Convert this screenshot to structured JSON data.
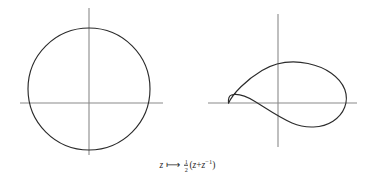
{
  "figure": {
    "background_color": "#ffffff",
    "axis_color": "#8a8a8a",
    "curve_color": "#2b2b2b",
    "caption": {
      "variable": "z",
      "arrow_glyph": "⟼",
      "fraction_numerator": "1",
      "fraction_denominator": "2",
      "open_paren": "(",
      "expr_first": "z",
      "plus": "+",
      "expr_second": "z",
      "exponent": "−1",
      "close_paren": ")",
      "full_text": "z ⟼ ½(z + z⁻¹)"
    },
    "left_panel": {
      "name": "unit-circle-domain",
      "axis_x": {
        "x1": 20,
        "y1": 103,
        "x2": 163,
        "y2": 103
      },
      "axis_y": {
        "x1": 89,
        "y1": 8,
        "x2": 89,
        "y2": 155
      },
      "circle": {
        "cx": 89,
        "cy": 89,
        "r": 61
      }
    },
    "right_panel": {
      "name": "joukowski-image-curve",
      "axis_x": {
        "x1": 208,
        "y1": 103,
        "x2": 357,
        "y2": 103
      },
      "axis_y": {
        "x1": 278,
        "y1": 14,
        "x2": 278,
        "y2": 147
      },
      "curve_path": "M 228.5 103.2 C 233 94 246 80 262 70.5 C 276 62.2 292 60.3 308 63.5 C 326 67 340 77 344.5 89.5 C 349 102 344 114 333 121 C 322 128 306 129 292 123 C 278 117 266 108 255 101.5 C 246 96 237 93.5 231.5 95 C 229 95.7 228.2 98.5 228.5 103.2 Z",
      "cusp_point": {
        "x": 228.5,
        "y": 103
      },
      "right_tip": {
        "x": 345,
        "y": 95
      },
      "upper_peak": {
        "x": 290,
        "y": 62
      },
      "lower_trough": {
        "x": 320,
        "y": 126
      }
    }
  }
}
